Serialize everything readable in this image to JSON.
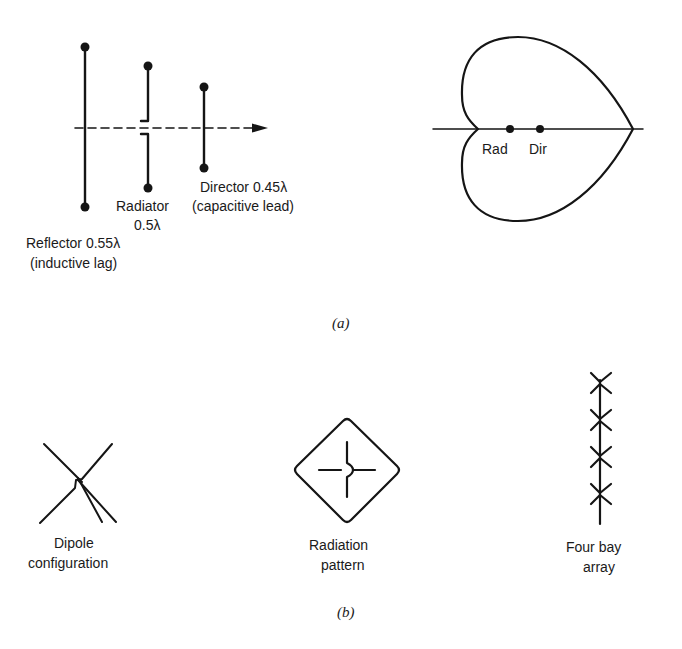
{
  "panel_a": {
    "caption": "(a)",
    "yagi": {
      "reflector": {
        "label_line1": "Reflector 0.55λ",
        "label_line2": "(inductive lag)"
      },
      "radiator": {
        "label_line1": "Radiator",
        "label_line2": "0.5λ"
      },
      "director": {
        "label_line1": "Director 0.45λ",
        "label_line2": "(capacitive lead)"
      },
      "axis": "dashed direction arrow"
    },
    "pattern": {
      "shape": "cardioid",
      "points": [
        {
          "label": "Rad"
        },
        {
          "label": "Dir"
        }
      ]
    }
  },
  "panel_b": {
    "caption": "(b)",
    "items": [
      {
        "label_line1": "Dipole",
        "label_line2": "configuration"
      },
      {
        "label_line1": "Radiation",
        "label_line2": "pattern"
      },
      {
        "label_line1": "Four bay",
        "label_line2": "array"
      }
    ]
  },
  "colors": {
    "ink": "#151515",
    "background": "#ffffff"
  }
}
